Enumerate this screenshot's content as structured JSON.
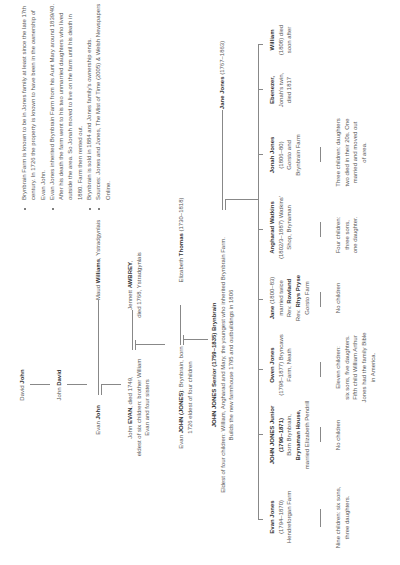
{
  "ancestors": {
    "david_john": {
      "first": "David",
      "surname": "John"
    },
    "john_david": {
      "first": "John",
      "surname": "David"
    },
    "evan_john": {
      "first": "Evan",
      "surname": "John"
    },
    "maud_williams": {
      "first": "Maud",
      "surname": "Williams",
      "place": ", Ystradgynlais"
    },
    "john_evan": {
      "first": "John",
      "surname": "EVAN",
      "detail1": ", died 1749,",
      "detail2": "eldest of six children: brother William",
      "detail3": "Evan and four sisters"
    },
    "jennett_awbrey": {
      "first": "Jennett",
      "surname": "AWBREY",
      "detail1": ",",
      "detail2": "died 1768, Ystradgynlais"
    },
    "evan_john_jones": {
      "first": "Evan",
      "surname": "JOHN (JONES)",
      "detail1": ": Brynbrain, born",
      "detail2": "1726 eldest of four children"
    },
    "elizabeth_thomas": {
      "first": "Elizabeth",
      "surname": "Thomas",
      "dates": " (1730–1818)"
    },
    "john_jones_senior": {
      "name": "JOHN JONES Senior (1759–1835) Brynbrain",
      "detail1": "Eldest of four children: William, Angharad and Mary, the youngest who inherited Brynbrain Farm.",
      "detail2": "Builds the new farmhouse 1795 and outbuildings in 1806"
    },
    "jane_jones": {
      "first": "Jane",
      "surname": "Jones",
      "dates": " (1767–1863)"
    }
  },
  "children": [
    {
      "name": "Evan Jones",
      "lines": [
        "(1794–1870)",
        "Hendreforgan Farm"
      ],
      "descendants": [
        "Nine children: six sons,",
        "three daughters."
      ]
    },
    {
      "name": "JOHN JONES Junior",
      "name2": "(1796–1871)",
      "lines": [
        "Born Brynbrain,"
      ],
      "bold_line": "Brynaman House,",
      "lines2": [
        "married Elizabeth Pendrill"
      ],
      "descendants": [
        "No children"
      ]
    },
    {
      "name": "Owen Jones",
      "lines": [
        "(1798–1877) Bryncaws",
        "Farm, Neath"
      ],
      "descendants": [
        "Eleven children:",
        "six sons, five daughters.",
        "Fifth child William Arthur",
        "Jones had the family Bible",
        "in America."
      ]
    },
    {
      "name": "Jane",
      "name_suffix": " (1800–83)",
      "lines": [
        "married twice"
      ],
      "rev1_prefix": "Rev. ",
      "rev1": "Rowland",
      "rev2_prefix": "Rev. ",
      "rev2": "Rhys Pryse",
      "lines2": [
        "Gorsto Farm"
      ],
      "descendants": [
        "No children"
      ]
    },
    {
      "name": "Angharad Watkins",
      "lines": [
        "(1802/3–1887) Watkins'",
        "Shop, Brynaman"
      ],
      "descendants": [
        "Four children:",
        "three sons,",
        "one daughter."
      ]
    },
    {
      "name": "Jonah Jones",
      "lines": [
        "(1806–80)",
        "Gorsto and",
        "Brynbrain Farm"
      ],
      "descendants": [
        "Three children: daughters",
        "two died in their 20s. One",
        "married and moved out",
        "of area."
      ]
    },
    {
      "name": "Ebenezer,",
      "lines": [
        "Jonah's twin,",
        "died 1817"
      ],
      "descendants": []
    },
    {
      "name": "William",
      "lines": [
        "(1808) died",
        "soon after"
      ],
      "descendants": []
    }
  ],
  "notes": [
    "Brynbrain Farm is known to be in Jones family at least since the late 17th century. In 1726 the property is known to have been in the ownership of Evan John.",
    "Evan Jones inherited Brynbrain Farm from his Aunt Mary around 1839/40. After his death the farm went to his two unmarried daughters who lived outside the area. So Jonah moved to live on the farm until his death in 1880. Farm then rented out.",
    "Brynbrain is sold in 1884 and Jones family's ownership ends.",
    "Sources: Jones and Jones, The Mist of Time (2005) & Welsh Newspapers Online."
  ],
  "colors": {
    "line": "#888888",
    "text": "#555555",
    "bold": "#333333",
    "background": "#ffffff"
  }
}
